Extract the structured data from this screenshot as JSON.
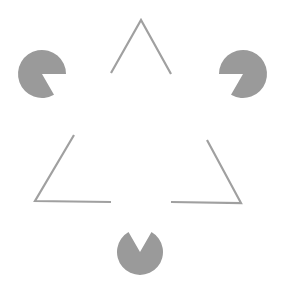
{
  "figure": {
    "title": "Kanizsa triangle illusion",
    "background": "#ffffff",
    "pacman_color": "#9a9a9a",
    "line_color": "#a0a0a0",
    "line_width": 2.2
  },
  "pacmen": [
    {
      "name": "top-left-pacman",
      "cx": 42,
      "cy": 74,
      "r": 24,
      "wedge_start_deg": 0,
      "wedge_end_deg": 60
    },
    {
      "name": "top-right-pacman",
      "cx": 243,
      "cy": 74,
      "r": 24,
      "wedge_start_deg": 120,
      "wedge_end_deg": 180
    },
    {
      "name": "bottom-pacman",
      "cx": 140,
      "cy": 252,
      "r": 23,
      "wedge_start_deg": 240,
      "wedge_end_deg": 300
    }
  ],
  "corners": [
    {
      "name": "top-corner",
      "points": [
        [
          111,
          73
        ],
        [
          141,
          20
        ],
        [
          171,
          74
        ]
      ]
    },
    {
      "name": "bottom-left-corner",
      "points": [
        [
          74,
          135
        ],
        [
          35,
          201
        ],
        [
          111,
          202
        ]
      ]
    },
    {
      "name": "bottom-right-corner",
      "points": [
        [
          207,
          140
        ],
        [
          241,
          203
        ],
        [
          171,
          202
        ]
      ]
    }
  ]
}
